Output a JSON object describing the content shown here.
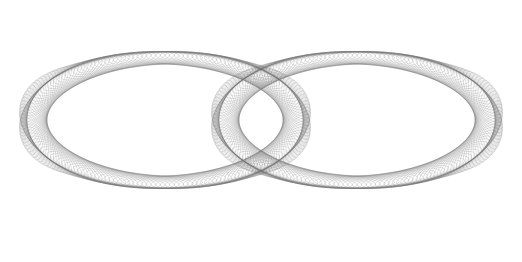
{
  "image": {
    "subject": "wireframe coil forming a figure-eight double torus",
    "background": "#ffffff",
    "stroke_color": "#6e6e6e",
    "width": 522,
    "height": 262
  },
  "tori": [
    {
      "name": "left-loop",
      "cx": 165,
      "cy": 118,
      "rx": 128,
      "ry": 62,
      "tube_rx": 26,
      "tube_ry": 40,
      "rings": 170
    },
    {
      "name": "right-loop",
      "cx": 357,
      "cy": 118,
      "rx": 128,
      "ry": 62,
      "tube_rx": 26,
      "tube_ry": 40,
      "rings": 170
    }
  ]
}
